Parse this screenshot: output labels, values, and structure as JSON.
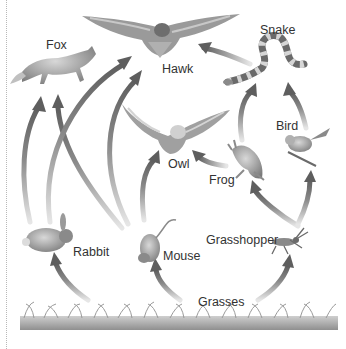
{
  "diagram": {
    "type": "food-web",
    "colors": {
      "arrow": "#6e6e6e",
      "arrow_fade": "#dcdcdc",
      "grass": "#9e9e9e",
      "text": "#333333",
      "background": "#ffffff"
    },
    "organisms": [
      {
        "id": "fox",
        "label": "Fox",
        "icon": "fox-icon"
      },
      {
        "id": "hawk",
        "label": "Hawk",
        "icon": "hawk-icon"
      },
      {
        "id": "snake",
        "label": "Snake",
        "icon": "snake-icon"
      },
      {
        "id": "owl",
        "label": "Owl",
        "icon": "owl-icon"
      },
      {
        "id": "bird",
        "label": "Bird",
        "icon": "bird-icon"
      },
      {
        "id": "frog",
        "label": "Frog",
        "icon": "frog-icon"
      },
      {
        "id": "rabbit",
        "label": "Rabbit",
        "icon": "rabbit-icon"
      },
      {
        "id": "mouse",
        "label": "Mouse",
        "icon": "mouse-icon"
      },
      {
        "id": "grasshopper",
        "label": "Grasshopper",
        "icon": "grasshopper-icon"
      },
      {
        "id": "grasses",
        "label": "Grasses",
        "icon": "grass-icon"
      }
    ],
    "edges": [
      {
        "from": "rabbit",
        "to": "fox"
      },
      {
        "from": "mouse",
        "to": "fox"
      },
      {
        "from": "rabbit",
        "to": "hawk"
      },
      {
        "from": "mouse",
        "to": "hawk"
      },
      {
        "from": "snake",
        "to": "hawk"
      },
      {
        "from": "mouse",
        "to": "owl"
      },
      {
        "from": "frog",
        "to": "owl"
      },
      {
        "from": "frog",
        "to": "snake"
      },
      {
        "from": "bird",
        "to": "snake"
      },
      {
        "from": "grasshopper",
        "to": "frog"
      },
      {
        "from": "grasshopper",
        "to": "bird"
      },
      {
        "from": "grasses",
        "to": "rabbit"
      },
      {
        "from": "grasses",
        "to": "mouse"
      },
      {
        "from": "grasses",
        "to": "grasshopper"
      }
    ]
  }
}
